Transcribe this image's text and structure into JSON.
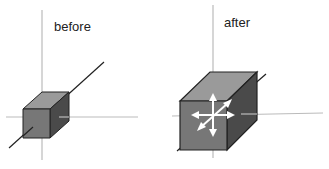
{
  "panels": [
    {
      "id": "before",
      "label": "before"
    },
    {
      "id": "after",
      "label": "after"
    }
  ],
  "colors": {
    "axis_light": "#bbbbbb",
    "axis_dark": "#222222",
    "front_face": "#777777",
    "top_face": "#9a9a9a",
    "side_face": "#4a4a4a",
    "arrow": "#ffffff"
  }
}
